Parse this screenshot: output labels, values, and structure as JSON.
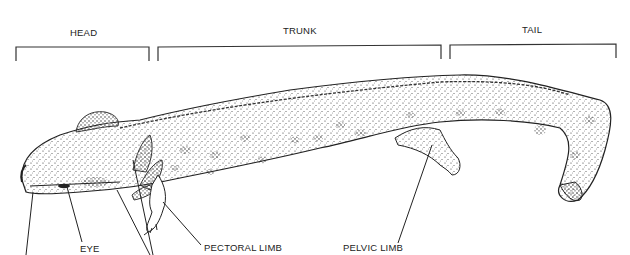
{
  "diagram": {
    "regions": [
      {
        "label": "HEAD",
        "x": 53,
        "bracket": [
          16,
          149
        ]
      },
      {
        "label": "TRUNK",
        "x": 286,
        "bracket": [
          158,
          441
        ]
      },
      {
        "label": "TAIL",
        "x": 521,
        "bracket": [
          450,
          616
        ]
      }
    ],
    "callouts": [
      {
        "label": "EYE"
      },
      {
        "label": "PECTORAL LIMB"
      },
      {
        "label": "PELVIC LIMB"
      }
    ],
    "colors": {
      "ink": "#222222",
      "background": "#ffffff"
    }
  }
}
